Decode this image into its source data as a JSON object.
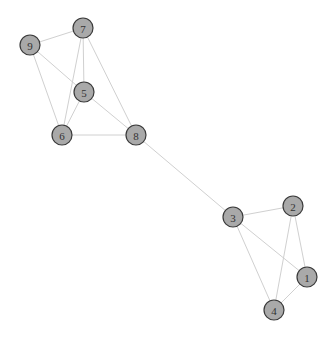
{
  "graph": {
    "node_fill": "#a9a9a9",
    "node_stroke": "#3a3a3a",
    "edge_color": "#d0d0d0",
    "nodes": [
      {
        "id": "1",
        "label": "1",
        "x": 307,
        "y": 277
      },
      {
        "id": "2",
        "label": "2",
        "x": 293,
        "y": 206
      },
      {
        "id": "3",
        "label": "3",
        "x": 233,
        "y": 217
      },
      {
        "id": "4",
        "label": "4",
        "x": 274,
        "y": 310
      },
      {
        "id": "5",
        "label": "5",
        "x": 84,
        "y": 92
      },
      {
        "id": "6",
        "label": "6",
        "x": 62,
        "y": 135
      },
      {
        "id": "7",
        "label": "7",
        "x": 83,
        "y": 28
      },
      {
        "id": "8",
        "label": "8",
        "x": 136,
        "y": 135
      },
      {
        "id": "9",
        "label": "9",
        "x": 30,
        "y": 45
      }
    ],
    "edges": [
      [
        "9",
        "7"
      ],
      [
        "9",
        "5"
      ],
      [
        "9",
        "6"
      ],
      [
        "7",
        "5"
      ],
      [
        "7",
        "6"
      ],
      [
        "7",
        "8"
      ],
      [
        "5",
        "6"
      ],
      [
        "5",
        "8"
      ],
      [
        "6",
        "8"
      ],
      [
        "8",
        "3"
      ],
      [
        "3",
        "2"
      ],
      [
        "3",
        "1"
      ],
      [
        "3",
        "4"
      ],
      [
        "2",
        "1"
      ],
      [
        "2",
        "4"
      ],
      [
        "1",
        "4"
      ]
    ]
  }
}
